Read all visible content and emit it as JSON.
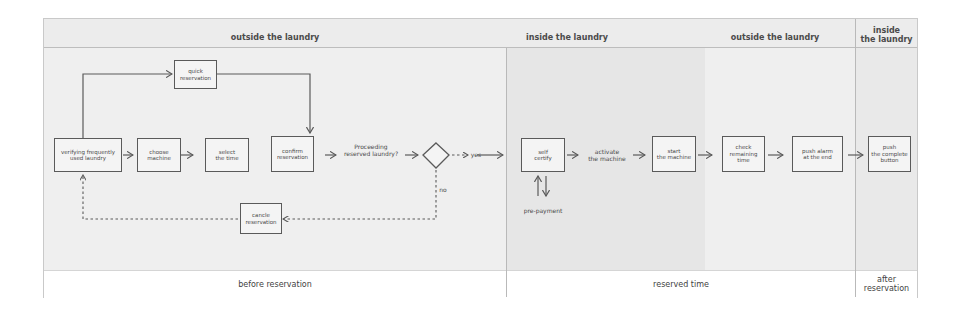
{
  "header": {
    "zones": [
      {
        "label": "outside the laundry"
      },
      {
        "label": "inside the laundry"
      },
      {
        "label": "outside the laundry"
      },
      {
        "label": "inside\nthe laundry",
        "line1": "inside",
        "line2": "the laundry"
      }
    ]
  },
  "footer": {
    "phases": [
      {
        "label": "before reservation"
      },
      {
        "label": "reserved time"
      },
      {
        "label": "after reservation",
        "line1": "after",
        "line2": "reservation"
      }
    ]
  },
  "nodes": {
    "verifying": {
      "line1": "verifying frequently",
      "line2": "used laundry"
    },
    "quick_reservation": {
      "line1": "quick",
      "line2": "reservation"
    },
    "choose_machine": {
      "line1": "choose",
      "line2": "machine"
    },
    "select_time": {
      "line1": "select",
      "line2": "the time"
    },
    "confirm_reservation": {
      "line1": "confirm",
      "line2": "reservation"
    },
    "cancel_reservation": {
      "line1": "cancle",
      "line2": "reservation"
    },
    "self_certify": {
      "line1": "self",
      "line2": "certify"
    },
    "start_machine": {
      "line1": "start",
      "line2": "the machine"
    },
    "check_remaining": {
      "line1": "check",
      "line2": "remaining",
      "line3": "time"
    },
    "push_alarm": {
      "line1": "push alarm",
      "line2": "at the end"
    },
    "push_complete": {
      "line1": "push",
      "line2": "the complete",
      "line3": "button"
    }
  },
  "labels": {
    "proceeding": {
      "line1": "Proceeding",
      "line2": "reserved laundry?"
    },
    "yes": "yes",
    "no": "no",
    "activate": {
      "line1": "activate",
      "line2": "the machine"
    },
    "pre_payment": "pre-payment"
  },
  "colors": {
    "line": "#5a5a5a",
    "header_bg": "#ececec",
    "body_bg": "#efefef",
    "inside_zone_bg": "#e6e6e6"
  }
}
